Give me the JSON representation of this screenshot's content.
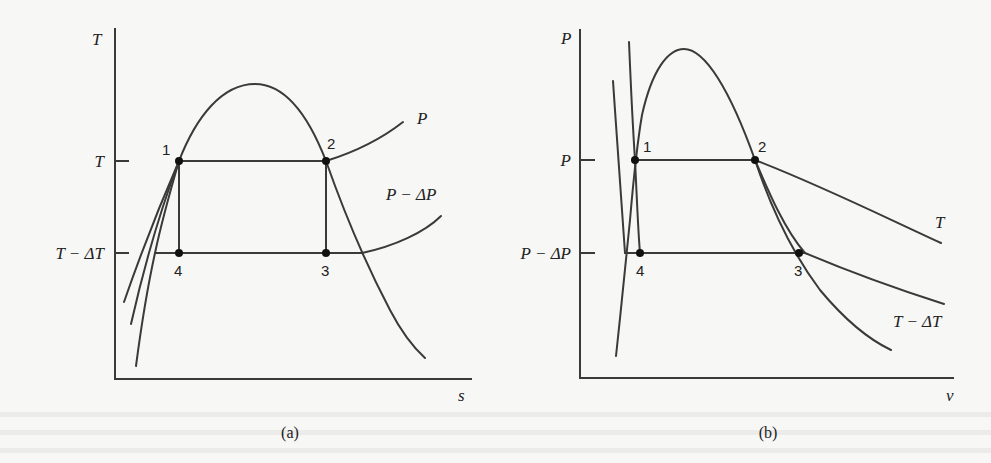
{
  "figure": {
    "panels": [
      {
        "id": "a",
        "caption": "(a)",
        "y_axis_label": "T",
        "x_axis_label": "s",
        "tick_labels": [
          "T",
          "T − ΔT"
        ],
        "curve_labels": [
          "P",
          "P − ΔP"
        ],
        "state_points": [
          "1",
          "2",
          "3",
          "4"
        ]
      },
      {
        "id": "b",
        "caption": "(b)",
        "y_axis_label": "P",
        "x_axis_label": "v",
        "tick_labels": [
          "P",
          "P − ΔP"
        ],
        "curve_labels": [
          "T",
          "T − ΔT"
        ],
        "state_points": [
          "1",
          "2",
          "3",
          "4"
        ]
      }
    ],
    "colors": {
      "line": "#3a3a3a",
      "background": "#f7f7f6",
      "bleed_text": "#ececea"
    }
  }
}
